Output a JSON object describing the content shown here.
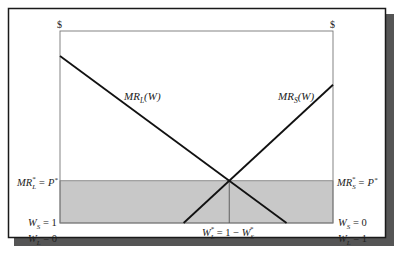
{
  "diagram": {
    "colors": {
      "frame": "#1a1a1a",
      "shadow": "#555555",
      "axis": "#777777",
      "curve": "#111111",
      "shade": "#c8c8c8",
      "background": "#ffffff"
    },
    "axes": {
      "left_unit": "$",
      "right_unit": "$"
    },
    "curves": {
      "mr_l": {
        "label_main": "MR",
        "label_sub": "L",
        "label_arg": "(W)"
      },
      "mr_s": {
        "label_main": "MR",
        "label_sub": "S",
        "label_arg": "(W)"
      }
    },
    "labels": {
      "left_price": {
        "main": "MR",
        "sub": "L",
        "sup": "*",
        "rest": " = P",
        "rest_sup": "*"
      },
      "right_price": {
        "main": "MR",
        "sub": "S",
        "sup": "*",
        "rest": " = P",
        "rest_sup": "*"
      },
      "left_bottom_1": {
        "main": "W",
        "sub": "S",
        "rest": " = 1"
      },
      "left_bottom_2": {
        "main": "W",
        "sub": "L",
        "rest": " = 0"
      },
      "right_bottom_1": {
        "main": "W",
        "sub": "S",
        "rest": " = 0"
      },
      "right_bottom_2": {
        "main": "W",
        "sub": "L",
        "rest": " = 1"
      },
      "equilibrium": {
        "main": "W",
        "sub": "L",
        "sup": "*",
        "mid": " = 1 − ",
        "main2": "W",
        "sub2": "S",
        "sup2": "*"
      }
    },
    "model": {
      "w_range": [
        0,
        1
      ],
      "mr_l_top_fraction": 0.87,
      "mr_s_top_fraction": 0.72,
      "price_fraction": 0.22,
      "equilibrium_w_l": 0.62
    }
  }
}
